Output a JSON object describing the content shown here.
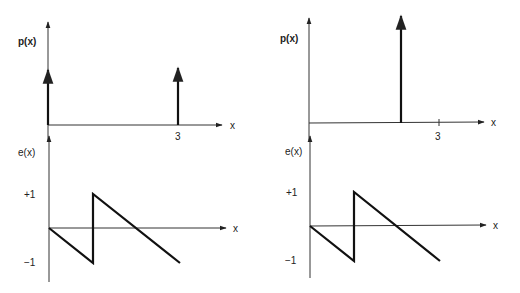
{
  "panels": [
    {
      "id": "left",
      "top_plot": {
        "ylabel": "p(x)",
        "xlabel": "x",
        "tick_label": "3",
        "impulses": [
          {
            "x": 0,
            "height": "equal"
          },
          {
            "x": 3,
            "height": "equal"
          }
        ]
      },
      "bottom_plot": {
        "ylabel": "e(x)",
        "xlabel": "x",
        "pos_tick": "+1",
        "neg_tick": "−1",
        "waveform": "sawtooth"
      }
    },
    {
      "id": "right",
      "top_plot": {
        "ylabel": "p(x)",
        "xlabel": "x",
        "tick_label": "3",
        "impulses": [
          {
            "x": 2,
            "height": "double"
          }
        ]
      },
      "bottom_plot": {
        "ylabel": "e(x)",
        "xlabel": "x",
        "pos_tick": "+1",
        "neg_tick": "−1",
        "waveform": "sawtooth"
      }
    }
  ]
}
